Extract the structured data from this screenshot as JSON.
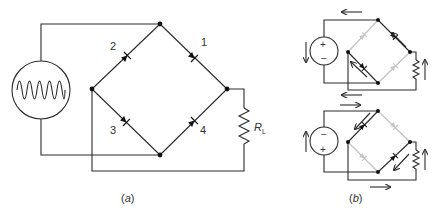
{
  "figure": {
    "panel_a": {
      "caption_open": "(",
      "caption_letter": "a",
      "caption_close": ")",
      "diodes": [
        {
          "label": "1",
          "branch": "top-right",
          "direction": "top-to-right"
        },
        {
          "label": "2",
          "branch": "top-left",
          "direction": "left-to-top"
        },
        {
          "label": "3",
          "branch": "bottom-left",
          "direction": "left-to-bottom"
        },
        {
          "label": "4",
          "branch": "bottom-right",
          "direction": "bottom-to-right"
        }
      ],
      "load_label": "R",
      "load_subscript": "L",
      "source": "ac-sine-source"
    },
    "panel_b": {
      "caption_open": "(",
      "caption_letter": "b",
      "caption_close": ")",
      "top_circuit": {
        "source_plus": "+",
        "source_minus": "−",
        "conducting_diodes": [
          "1",
          "3"
        ],
        "off_diodes": [
          "2",
          "4"
        ]
      },
      "bottom_circuit": {
        "source_plus": "+",
        "source_minus": "−",
        "conducting_diodes": [
          "2",
          "4"
        ],
        "off_diodes": [
          "1",
          "3"
        ]
      }
    },
    "colors": {
      "wire": "#2b2b2b",
      "inactive_diode": "#c4c4c4",
      "node": "#111111"
    }
  }
}
